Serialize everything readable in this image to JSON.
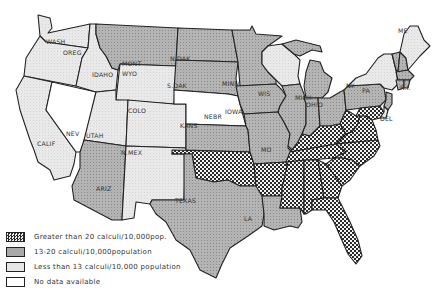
{
  "map": {
    "type": "choropleth",
    "subject": "Urinary calculi rate by state",
    "colors": {
      "stroke": "#222222",
      "greater_than_20": "checkered-dark",
      "13_to_20": "#a9a9a9",
      "less_than_13": "#e6e6e6",
      "no_data": "#ffffff"
    },
    "legend": [
      {
        "category": "greater_than_20",
        "label": "Greater than 20 calculi/10,000pop."
      },
      {
        "category": "13_to_20",
        "label": "13-20 calculi/10,000population"
      },
      {
        "category": "less_than_13",
        "label": "Less than 13 calculi/10,000 population"
      },
      {
        "category": "no_data",
        "label": "No data available"
      }
    ],
    "state_labels": {
      "wash": "WASH",
      "oreg": "OREG",
      "idaho": "IDAHO",
      "mont": "MONT",
      "wyo": "WYO",
      "calif": "CALIF",
      "nev": "NEV",
      "utah": "UTAH",
      "colo": "COLO",
      "ariz": "ARIZ",
      "nmex": "N.MEX",
      "ndak": "N.DAK",
      "sdak": "S.DAK",
      "nebr": "NEBR",
      "kans": "KANS",
      "okla": "OKLA",
      "texas": "TEXAS",
      "minn": "MINN",
      "iowa": "IOWA",
      "mo": "MO",
      "ark": "ARK",
      "la": "LA",
      "wis": "WIS",
      "mich": "MICH",
      "ill": "ILL",
      "ind": "IND",
      "ohio": "OHIO",
      "ky": "KY",
      "tenn": "TENN",
      "miss": "MISS",
      "ala": "ALA",
      "ga": "GA",
      "fla": "FLA",
      "sc": "S.C.",
      "nc": "N.C.",
      "va": "VA",
      "wva": "W.VA",
      "pa": "PA",
      "ny": "NY",
      "me": "ME",
      "del": "DEL",
      "ri": "R.I."
    },
    "state_categories": {
      "WASH": "less_than_13",
      "OREG": "less_than_13",
      "IDAHO": "less_than_13",
      "MONT": "13_to_20",
      "WYO": "less_than_13",
      "CALIF": "less_than_13",
      "NEV": "no_data",
      "UTAH": "less_than_13",
      "COLO": "less_than_13",
      "ARIZ": "13_to_20",
      "N.MEX": "less_than_13",
      "N.DAK": "13_to_20",
      "S.DAK": "13_to_20",
      "NEBR": "no_data",
      "KANS": "13_to_20",
      "OKLA": "greater_than_20",
      "TEXAS": "13_to_20",
      "MINN": "13_to_20",
      "IOWA": "13_to_20",
      "MO": "13_to_20",
      "ARK": "greater_than_20",
      "LA": "13_to_20",
      "WIS": "less_than_13",
      "MICH": "13_to_20",
      "ILL": "13_to_20",
      "IND": "13_to_20",
      "OHIO": "13_to_20",
      "KY": "greater_than_20",
      "TENN": "greater_than_20",
      "MISS": "greater_than_20",
      "ALA": "greater_than_20",
      "GA": "greater_than_20",
      "FLA": "greater_than_20",
      "S.C.": "greater_than_20",
      "N.C.": "greater_than_20",
      "VA": "greater_than_20",
      "W.VA": "greater_than_20",
      "PA": "13_to_20",
      "NY": "less_than_13",
      "ME": "less_than_13",
      "VT": "13_to_20",
      "N.H.": "13_to_20",
      "MASS": "13_to_20",
      "CONN": "13_to_20",
      "R.I.": "13_to_20",
      "N.J.": "13_to_20",
      "DEL": "less_than_13",
      "MD": "greater_than_20"
    }
  }
}
